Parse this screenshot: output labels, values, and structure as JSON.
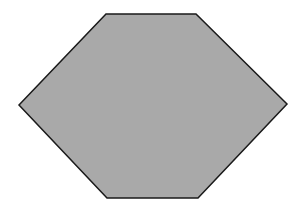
{
  "figure": {
    "shape": "hexagon",
    "fill": "#a9a9a9",
    "stroke": "#1a1a1a",
    "stroke_width": 1.5,
    "points": "106,14 196,14 287,104 198,198 107,198 19,105"
  },
  "background": {
    "color": "#ffffff",
    "note": "faint bleed-through text, illegible"
  }
}
